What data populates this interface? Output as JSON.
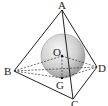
{
  "diagram": {
    "type": "geometry-3d",
    "points": {
      "A": {
        "label": "A",
        "x": 62,
        "y": 10
      },
      "B": {
        "label": "B",
        "x": 14,
        "y": 71
      },
      "C": {
        "label": "C",
        "x": 73,
        "y": 99
      },
      "D": {
        "label": "D",
        "x": 97,
        "y": 67
      },
      "O": {
        "label": "O",
        "x": 62,
        "y": 56
      },
      "G": {
        "label": "G",
        "x": 62,
        "y": 78
      }
    },
    "sphere": {
      "center": "O",
      "cx": 63,
      "cy": 56,
      "r": 22
    },
    "solid_edges": [
      [
        "A",
        "B"
      ],
      [
        "A",
        "C"
      ],
      [
        "A",
        "D"
      ],
      [
        "B",
        "C"
      ],
      [
        "C",
        "D"
      ]
    ],
    "dashed_edges": [
      [
        "B",
        "D"
      ],
      [
        "B",
        "O"
      ],
      [
        "O",
        "D"
      ],
      [
        "A",
        "G"
      ],
      [
        "O",
        "G"
      ],
      [
        "B",
        "G"
      ],
      [
        "G",
        "D"
      ]
    ],
    "colors": {
      "line": "#222222",
      "sphere_light": "#f2f2f2",
      "sphere_dark": "#9a9a9a"
    }
  }
}
